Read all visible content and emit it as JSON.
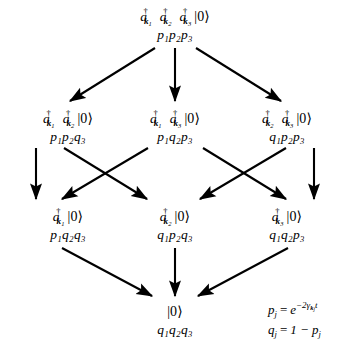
{
  "diagram": {
    "type": "quantum-decay-cascade",
    "ink_color": "#000000",
    "background_color": "#ffffff",
    "levels": [
      {
        "level": 0,
        "nodes": [
          {
            "id": "n3-k1k2k3",
            "operators": [
              "k1",
              "k2",
              "k3"
            ],
            "state_label": "a_k1^dagger a_k2^dagger a_k3^dagger |0>",
            "probability_label": "p1 p2 p3",
            "prob_factors": [
              "p1",
              "p2",
              "p3"
            ],
            "x": 175,
            "y": 8
          }
        ]
      },
      {
        "level": 1,
        "nodes": [
          {
            "id": "n2-k1k2",
            "operators": [
              "k1",
              "k2"
            ],
            "state_label": "a_k1^dagger a_k2^dagger |0>",
            "probability_label": "p1 p2 q3",
            "prob_factors": [
              "p1",
              "p2",
              "q3"
            ],
            "x": 68,
            "y": 110
          },
          {
            "id": "n2-k1k3",
            "operators": [
              "k1",
              "k3"
            ],
            "state_label": "a_k1^dagger a_k3^dagger |0>",
            "probability_label": "p1 q2 p3",
            "prob_factors": [
              "p1",
              "q2",
              "p3"
            ],
            "x": 175,
            "y": 110
          },
          {
            "id": "n2-k2k3",
            "operators": [
              "k2",
              "k3"
            ],
            "state_label": "a_k2^dagger a_k3^dagger |0>",
            "probability_label": "q1 p2 p3",
            "prob_factors": [
              "q1",
              "p2",
              "p3"
            ],
            "x": 287,
            "y": 110
          }
        ]
      },
      {
        "level": 2,
        "nodes": [
          {
            "id": "n1-k1",
            "operators": [
              "k1"
            ],
            "state_label": "a_k1^dagger |0>",
            "probability_label": "p1 q2 q3",
            "prob_factors": [
              "p1",
              "q2",
              "q3"
            ],
            "x": 68,
            "y": 208
          },
          {
            "id": "n1-k2",
            "operators": [
              "k2"
            ],
            "state_label": "a_k2^dagger |0>",
            "probability_label": "q1 p2 q3",
            "prob_factors": [
              "q1",
              "p2",
              "q3"
            ],
            "x": 175,
            "y": 208
          },
          {
            "id": "n1-k3",
            "operators": [
              "k3"
            ],
            "state_label": "a_k3^dagger |0>",
            "probability_label": "q1 q2 p3",
            "prob_factors": [
              "q1",
              "q2",
              "p3"
            ],
            "x": 287,
            "y": 208
          }
        ]
      },
      {
        "level": 3,
        "nodes": [
          {
            "id": "n0-vacuum",
            "operators": [],
            "state_label": "|0>",
            "probability_label": "q1 q2 q3",
            "prob_factors": [
              "q1",
              "q2",
              "q3"
            ],
            "x": 175,
            "y": 305
          }
        ]
      }
    ],
    "edges": [
      {
        "from": "n3-k1k2k3",
        "to": "n2-k1k2",
        "x1": 155,
        "y1": 48,
        "x2": 70,
        "y2": 101
      },
      {
        "from": "n3-k1k2k3",
        "to": "n2-k1k3",
        "x1": 175,
        "y1": 48,
        "x2": 175,
        "y2": 101
      },
      {
        "from": "n3-k1k2k3",
        "to": "n2-k2k3",
        "x1": 196,
        "y1": 48,
        "x2": 281,
        "y2": 101
      },
      {
        "from": "n2-k1k2",
        "to": "n1-k1",
        "x1": 36,
        "y1": 148,
        "x2": 36,
        "y2": 199
      },
      {
        "from": "n2-k1k2",
        "to": "n1-k2",
        "x1": 64,
        "y1": 148,
        "x2": 147,
        "y2": 199
      },
      {
        "from": "n2-k1k3",
        "to": "n1-k1",
        "x1": 148,
        "y1": 148,
        "x2": 62,
        "y2": 199
      },
      {
        "from": "n2-k1k3",
        "to": "n1-k3",
        "x1": 203,
        "y1": 148,
        "x2": 286,
        "y2": 199
      },
      {
        "from": "n2-k2k3",
        "to": "n1-k2",
        "x1": 286,
        "y1": 148,
        "x2": 200,
        "y2": 199
      },
      {
        "from": "n2-k2k3",
        "to": "n1-k3",
        "x1": 314,
        "y1": 148,
        "x2": 314,
        "y2": 199
      },
      {
        "from": "n1-k1",
        "to": "n0-vacuum",
        "x1": 62,
        "y1": 248,
        "x2": 152,
        "y2": 296
      },
      {
        "from": "n1-k2",
        "to": "n0-vacuum",
        "x1": 175,
        "y1": 248,
        "x2": 175,
        "y2": 296
      },
      {
        "from": "n1-k3",
        "to": "n0-vacuum",
        "x1": 288,
        "y1": 248,
        "x2": 198,
        "y2": 296
      }
    ],
    "formulas": {
      "decay_probability": "p_j = e^{-2 gamma_{k_j} t}",
      "complement_probability": "q_j = 1 - p_j",
      "p_symbol": "p",
      "q_symbol": "q",
      "index": "j",
      "exponent_coefficient": "-2",
      "rate_symbol": "gamma",
      "time_symbol": "t",
      "one": "1"
    }
  }
}
